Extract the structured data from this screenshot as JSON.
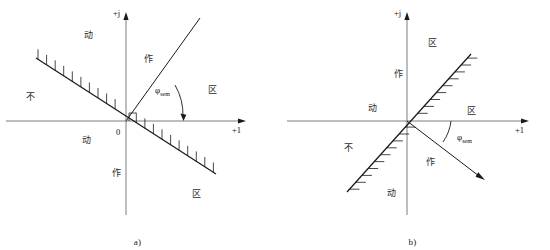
{
  "figure": {
    "background_color": "#ffffff",
    "line_color": "#1a1a1a",
    "panels": [
      {
        "id": "a",
        "caption": "a)",
        "axes": {
          "vertical_label": "+j",
          "horizontal_label": "+1",
          "origin_label": "0"
        },
        "angle": {
          "symbol": "φ",
          "subscript": "sem",
          "full_label": "φsem",
          "degrees": 62
        },
        "boundary_line": {
          "name": "hatched-boundary-line",
          "orientation": "descending",
          "hatch_side": "upper"
        },
        "ray": {
          "name": "phi-ray",
          "direction": "upper-right"
        },
        "right_angle_marker": true,
        "region_labels": [
          {
            "id": "a-q2-top",
            "text": "动",
            "x": 88,
            "y": 38
          },
          {
            "id": "a-q2-left",
            "text": "不",
            "x": 30,
            "y": 100
          },
          {
            "id": "a-q1-inner",
            "text": "作",
            "x": 148,
            "y": 62
          },
          {
            "id": "a-q1-outer",
            "text": "区",
            "x": 212,
            "y": 93
          },
          {
            "id": "a-q3-left",
            "text": "动",
            "x": 86,
            "y": 143
          },
          {
            "id": "a-q4-inner",
            "text": "作",
            "x": 116,
            "y": 176
          },
          {
            "id": "a-q4-outer",
            "text": "区",
            "x": 196,
            "y": 197
          }
        ]
      },
      {
        "id": "b",
        "caption": "b)",
        "axes": {
          "vertical_label": "+j",
          "horizontal_label": "+1",
          "origin_label": ""
        },
        "angle": {
          "symbol": "φ",
          "subscript": "sem",
          "full_label": "φsem",
          "degrees": -29
        },
        "boundary_line": {
          "name": "hatched-boundary-line",
          "orientation": "ascending",
          "hatch_side": "lower-right"
        },
        "ray": {
          "name": "phi-ray",
          "direction": "lower-right"
        },
        "right_angle_marker": false,
        "region_labels": [
          {
            "id": "b-q1-upper",
            "text": "区",
            "x": 157,
            "y": 46
          },
          {
            "id": "b-q1-mid",
            "text": "作",
            "x": 123,
            "y": 77
          },
          {
            "id": "b-q2-left",
            "text": "动",
            "x": 97,
            "y": 111
          },
          {
            "id": "b-q1-right",
            "text": "区",
            "x": 196,
            "y": 114
          },
          {
            "id": "b-q3-left",
            "text": "不",
            "x": 73,
            "y": 151
          },
          {
            "id": "b-q4-inner",
            "text": "作",
            "x": 155,
            "y": 165
          },
          {
            "id": "b-q3-lower",
            "text": "动",
            "x": 116,
            "y": 196
          }
        ]
      }
    ]
  }
}
